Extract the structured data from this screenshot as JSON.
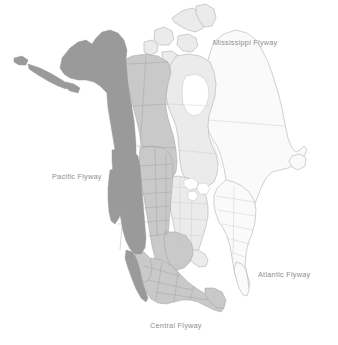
{
  "map": {
    "title": "North American Bird Migration Flyways",
    "background_color": "#ffffff",
    "border_color": "#9b9b9b",
    "label_color": "#8f8f8f",
    "regions": [
      {
        "id": "pacific",
        "label": "Pacific Flyway",
        "fill": "#9a9a9a",
        "label_x": 52,
        "label_y": 172,
        "includes": [
          "Alaska",
          "Yukon",
          "British Columbia",
          "Washington",
          "Oregon",
          "California",
          "Idaho",
          "Nevada",
          "Utah",
          "Arizona",
          "Baja California"
        ]
      },
      {
        "id": "central",
        "label": "Central Flyway",
        "fill": "#c9c9c9",
        "label_x": 150,
        "label_y": 321,
        "includes": [
          "Northwest Territories",
          "Alberta",
          "Saskatchewan",
          "Montana",
          "Wyoming",
          "Colorado",
          "New Mexico",
          "North Dakota",
          "South Dakota",
          "Nebraska",
          "Kansas",
          "Oklahoma",
          "Texas",
          "Mexico"
        ]
      },
      {
        "id": "mississippi",
        "label": "Mississippi Flyway",
        "fill": "#ebebeb",
        "label_x": 213,
        "label_y": 38,
        "includes": [
          "Manitoba",
          "Nunavut",
          "Ontario",
          "Minnesota",
          "Iowa",
          "Missouri",
          "Arkansas",
          "Louisiana",
          "Wisconsin",
          "Illinois",
          "Mississippi",
          "Michigan",
          "Indiana",
          "Kentucky",
          "Tennessee",
          "Alabama"
        ]
      },
      {
        "id": "atlantic",
        "label": "Atlantic Flyway",
        "fill": "#fafafa",
        "label_x": 258,
        "label_y": 270,
        "includes": [
          "Quebec",
          "Labrador",
          "Newfoundland",
          "Maritimes",
          "New England",
          "New York",
          "Pennsylvania",
          "Ohio",
          "West Virginia",
          "Virginia",
          "North Carolina",
          "South Carolina",
          "Georgia",
          "Florida"
        ]
      }
    ],
    "labels": [
      {
        "name": "mississippi-flyway-label",
        "text": "Mississippi Flyway"
      },
      {
        "name": "pacific-flyway-label",
        "text": "Pacific Flyway"
      },
      {
        "name": "atlantic-flyway-label",
        "text": "Atlantic Flyway"
      },
      {
        "name": "central-flyway-label",
        "text": "Central Flyway"
      }
    ]
  }
}
